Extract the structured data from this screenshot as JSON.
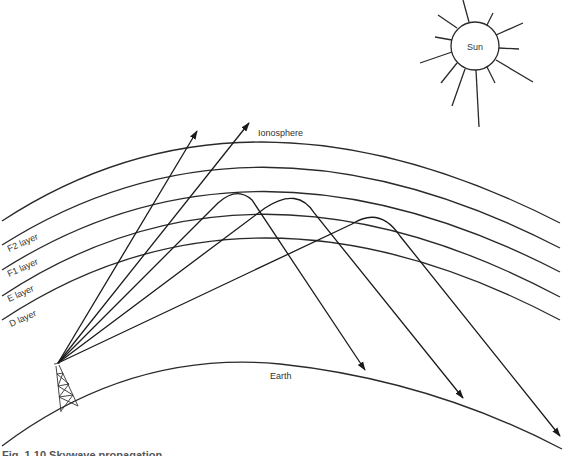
{
  "diagram": {
    "labels": {
      "sun": "Sun",
      "ionosphere": "Ionosphere",
      "earth": "Earth",
      "layers": [
        "F2 layer",
        "F1 layer",
        "E layer",
        "D layer"
      ]
    },
    "elements": {
      "sun": {
        "cx": 475,
        "cy": 46,
        "r": 24
      },
      "transmitter_tower": {
        "top": [
          57,
          364
        ],
        "base": [
          [
            61,
            412
          ],
          [
            78,
            406
          ]
        ]
      },
      "ionosphere_arcs": 5,
      "rays_escaping": 2,
      "rays_reflected": 3,
      "reflected_by": [
        "E layer",
        "F1 layer",
        "F2 layer"
      ]
    },
    "caption": "Fig. 1.10   Skywave propagation"
  }
}
